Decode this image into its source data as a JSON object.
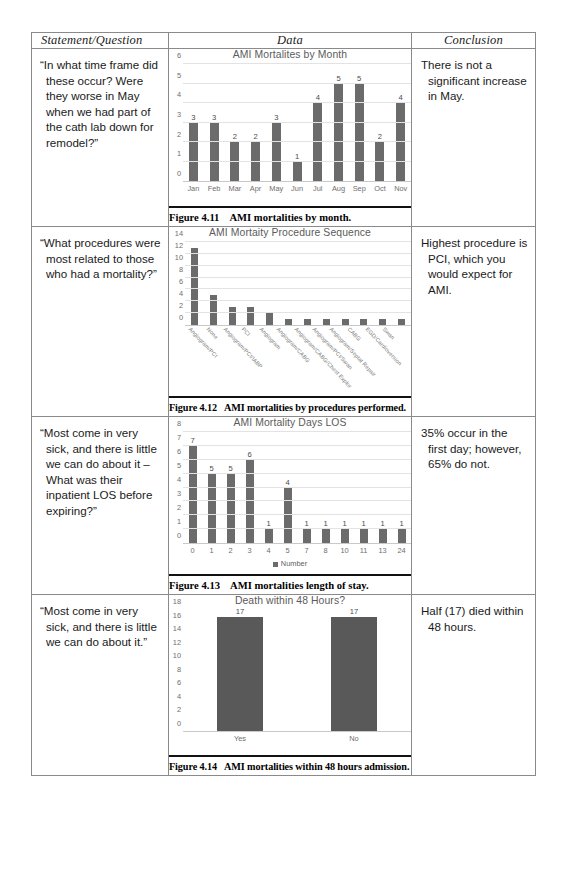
{
  "table": {
    "headers": {
      "statement": "Statement/Question",
      "data": "Data",
      "conclusion": "Conclusion"
    },
    "rows": [
      {
        "statement": "“In what time frame did these occur? Were they worse in May when we had part of the cath lab down for remodel?”",
        "conclusion": "There is not a significant increase in May.",
        "caption_number": "Figure 4.11",
        "caption_text": "AMI mortalities by month."
      },
      {
        "statement": "“What procedures were most related to those who had a mortality?”",
        "conclusion": "Highest procedure is PCI, which you would expect for AMI.",
        "caption_number": "Figure 4.12",
        "caption_text": "AMI mortalities by procedures performed."
      },
      {
        "statement": "“Most come in very sick, and there is little we can do about it – What was their inpatient LOS before expiring?”",
        "conclusion": "35% occur in the first day; however, 65% do not.",
        "caption_number": "Figure 4.13",
        "caption_text": "AMI mortalities length of stay."
      },
      {
        "statement": "“Most come in very sick, and there is little we can do about it.”",
        "conclusion": "Half (17) died within 48 hours.",
        "caption_number": "Figure 4.14",
        "caption_text": "AMI mortalities within 48 hours admission."
      }
    ]
  },
  "chart_data": [
    {
      "type": "bar",
      "title": "AMI Mortalites by Month",
      "categories": [
        "Jan",
        "Feb",
        "Mar",
        "Apr",
        "May",
        "Jun",
        "Jul",
        "Aug",
        "Sep",
        "Oct",
        "Nov"
      ],
      "values": [
        3,
        3,
        2,
        2,
        3,
        1,
        4,
        5,
        5,
        2,
        4
      ],
      "yticks": [
        0,
        1,
        2,
        3,
        4,
        5,
        6
      ],
      "ylim": [
        0,
        6
      ],
      "xlabel": "",
      "ylabel": "",
      "grid": true,
      "show_value_labels": true,
      "legend": null,
      "bar_color": "#6b6b6b"
    },
    {
      "type": "bar",
      "title": "AMI Mortaity Procedure Sequence",
      "categories": [
        "Angiogram/PCI",
        "None",
        "Angiogram/PCI/IABP",
        "PCI",
        "Angiogram",
        "Angiogram/CABG",
        "Angiogram/CABG/Chest Explor",
        "Angiogram/PCI/Swan",
        "Angiogram/Septal Repair",
        "CABG",
        "EGD/Cardioversion",
        "Swan"
      ],
      "values": [
        13,
        5,
        3,
        3,
        2,
        1,
        1,
        1,
        1,
        1,
        1,
        1
      ],
      "yticks": [
        0,
        2,
        4,
        6,
        8,
        10,
        12,
        14
      ],
      "ylim": [
        0,
        14
      ],
      "xlabel": "",
      "ylabel": "",
      "grid": true,
      "show_value_labels": false,
      "legend": null,
      "bar_color": "#6b6b6b"
    },
    {
      "type": "bar",
      "title": "AMI Mortality Days LOS",
      "categories": [
        "0",
        "1",
        "2",
        "3",
        "4",
        "5",
        "7",
        "8",
        "10",
        "11",
        "13",
        "24"
      ],
      "values": [
        7,
        5,
        5,
        6,
        1,
        4,
        1,
        1,
        1,
        1,
        1,
        1
      ],
      "yticks": [
        0,
        1,
        2,
        3,
        4,
        5,
        6,
        7,
        8
      ],
      "ylim": [
        0,
        8
      ],
      "xlabel": "",
      "ylabel": "",
      "grid": true,
      "show_value_labels": true,
      "legend": "Number",
      "bar_color": "#6b6b6b"
    },
    {
      "type": "bar",
      "title": "Death within 48 Hours?",
      "categories": [
        "Yes",
        "No"
      ],
      "values": [
        17,
        17
      ],
      "yticks": [
        0,
        2,
        4,
        6,
        8,
        10,
        12,
        14,
        16,
        18
      ],
      "ylim": [
        0,
        18
      ],
      "xlabel": "",
      "ylabel": "",
      "grid": false,
      "show_value_labels": true,
      "legend": null,
      "bar_color": "#595959"
    }
  ]
}
